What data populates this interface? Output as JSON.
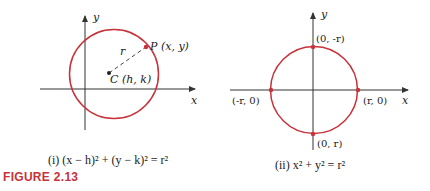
{
  "colors": {
    "circle": "#c8323a",
    "axis": "#333333",
    "figure_label": "#c8323a"
  },
  "figure_label": "FIGURE 2.13",
  "panels": [
    {
      "id": "i",
      "axes": {
        "x_label": "x",
        "y_label": "y"
      },
      "center_label": "C (h, k)",
      "point_label": "P (x, y)",
      "radius_label": "r",
      "caption": "(i) (x − h)² + (y − k)² = r²"
    },
    {
      "id": "ii",
      "axes": {
        "x_label": "x",
        "y_label": "y"
      },
      "points": [
        {
          "label": "(0, -r)",
          "position": "top"
        },
        {
          "label": "(-r, 0)",
          "position": "left"
        },
        {
          "label": "(r, 0)",
          "position": "right"
        },
        {
          "label": "(0, r)",
          "position": "bottom"
        }
      ],
      "caption": "(ii) x² + y² = r²"
    }
  ]
}
